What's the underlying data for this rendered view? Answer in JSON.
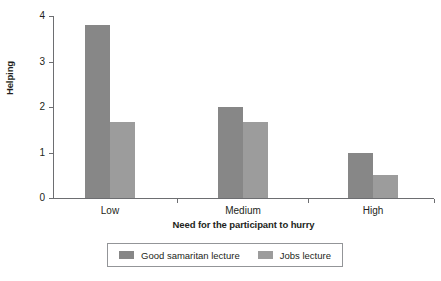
{
  "chart_data": {
    "type": "bar",
    "title": "",
    "subtitle": "",
    "xlabel": "Need for the participant to hurry",
    "ylabel": "Helping",
    "categories": [
      "Low",
      "Medium",
      "High"
    ],
    "series": [
      {
        "name": "Good samaritan lecture",
        "color": "#878787",
        "values": [
          3.8,
          2.0,
          1.0
        ]
      },
      {
        "name": "Jobs lecture",
        "color": "#9c9c9c",
        "values": [
          1.67,
          1.67,
          0.5
        ]
      }
    ],
    "ylim": [
      0,
      4
    ],
    "yticks": [
      0,
      1,
      2,
      3,
      4
    ],
    "ytick_labels": [
      "0",
      "1",
      "2",
      "3",
      "4"
    ],
    "grid": false,
    "legend_position": "bottom"
  },
  "axes": {
    "y_title": "Helping",
    "x_title": "Need for the participant to hurry",
    "y_tick_labels": [
      "0",
      "1",
      "2",
      "3",
      "4"
    ],
    "x_tick_labels": [
      "Low",
      "Medium",
      "High"
    ]
  },
  "legend": {
    "entries": [
      {
        "label": "Good samaritan lecture",
        "color": "#878787"
      },
      {
        "label": "Jobs lecture",
        "color": "#9c9c9c"
      }
    ]
  },
  "colors": {
    "axis": "#6d6e71",
    "text": "#231f20",
    "series_1": "#878787",
    "series_2": "#9c9c9c",
    "legend_border": "#939598",
    "background": "#ffffff"
  }
}
